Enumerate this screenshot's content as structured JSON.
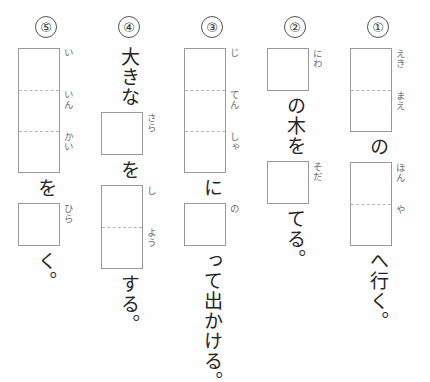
{
  "sheet": {
    "title": "漢字書き取りプリント",
    "columns": [
      {
        "number": "⑤",
        "items": [
          {
            "type": "box",
            "name": "answer-box-iinkai",
            "cells": 3,
            "furigana": [
              "い",
              "いん",
              "かい"
            ]
          },
          {
            "type": "text",
            "name": "particle-wo",
            "value": "を"
          },
          {
            "type": "box",
            "name": "answer-box-hira",
            "cells": 1,
            "furigana": [
              "ひら"
            ]
          },
          {
            "type": "text",
            "name": "okurigana-ku",
            "value": "く。"
          }
        ]
      },
      {
        "number": "④",
        "items": [
          {
            "type": "text",
            "name": "adjective-ookina",
            "value": "大きな"
          },
          {
            "type": "box",
            "name": "answer-box-sara",
            "cells": 1,
            "furigana": [
              "さら"
            ]
          },
          {
            "type": "text",
            "name": "particle-wo",
            "value": "を"
          },
          {
            "type": "box",
            "name": "answer-box-shiyou",
            "cells": 2,
            "furigana": [
              "し",
              "よう"
            ]
          },
          {
            "type": "text",
            "name": "verb-suru",
            "value": "する。"
          }
        ]
      },
      {
        "number": "③",
        "items": [
          {
            "type": "box",
            "name": "answer-box-jitensha",
            "cells": 3,
            "furigana": [
              "じ",
              "てん",
              "しゃ"
            ]
          },
          {
            "type": "text",
            "name": "particle-ni",
            "value": "に"
          },
          {
            "type": "box",
            "name": "answer-box-no",
            "cells": 1,
            "furigana": [
              "の"
            ]
          },
          {
            "type": "text",
            "name": "phrase-tte-dekakeru",
            "value": "って出かける。"
          }
        ]
      },
      {
        "number": "②",
        "items": [
          {
            "type": "box",
            "name": "answer-box-niwa",
            "cells": 1,
            "furigana": [
              "にわ"
            ]
          },
          {
            "type": "text",
            "name": "phrase-no-ki-wo",
            "value": "の木を"
          },
          {
            "type": "box",
            "name": "answer-box-soda",
            "cells": 1,
            "furigana": [
              "そだ"
            ]
          },
          {
            "type": "text",
            "name": "okurigana-teru",
            "value": "てる。"
          }
        ]
      },
      {
        "number": "①",
        "items": [
          {
            "type": "box",
            "name": "answer-box-ekimae",
            "cells": 2,
            "furigana": [
              "えき",
              "まえ"
            ]
          },
          {
            "type": "text",
            "name": "particle-no",
            "value": "の"
          },
          {
            "type": "box",
            "name": "answer-box-honya",
            "cells": 2,
            "furigana": [
              "ほん",
              "や"
            ]
          },
          {
            "type": "text",
            "name": "phrase-he-iku",
            "value": "へ行く。"
          }
        ]
      }
    ]
  }
}
